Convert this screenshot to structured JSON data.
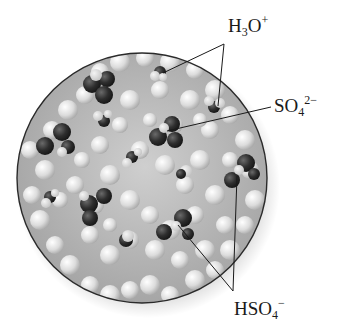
{
  "figure": {
    "labels": [
      {
        "id": "h3o",
        "base": "H",
        "sub1": "3",
        "mid": "O",
        "sup": "+"
      },
      {
        "id": "so4",
        "base": "SO",
        "sub": "4",
        "sup": "2−"
      },
      {
        "id": "hso4",
        "base": "HSO",
        "sub": "4",
        "sup": "−"
      }
    ],
    "colors": {
      "circle_outline": "#2a2a2a",
      "background_fill": "#b8b8b8",
      "water_molecule": "#e2e2e2",
      "oxygen_dark": "#2b2b2b",
      "leader_line": "#1a1a1a"
    }
  }
}
